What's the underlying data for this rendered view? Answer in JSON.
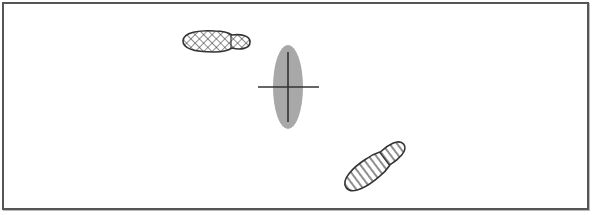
{
  "diagram": {
    "frame": {
      "stroke": "#555555",
      "background": "#ffffff"
    },
    "footprint_crosshatch": {
      "label": "",
      "pattern": "crosshatch",
      "stroke": "#333333"
    },
    "center_marker": {
      "label": "",
      "fill": "#a8a8a8",
      "stroke": "#333333"
    },
    "footprint_striped": {
      "label": "",
      "pattern": "stripes",
      "stroke": "#333333"
    }
  }
}
